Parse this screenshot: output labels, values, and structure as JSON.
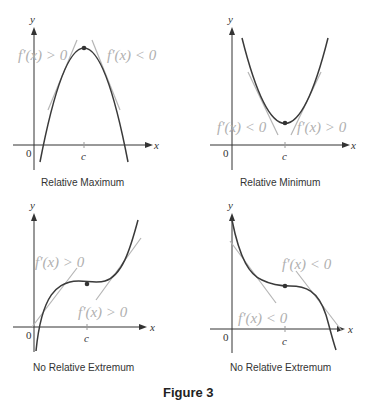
{
  "figure": {
    "label": "Figure 3",
    "panels": [
      {
        "id": "relative-maximum",
        "caption": "Relative Maximum",
        "left_label": "f′(x) > 0",
        "right_label": "f′(x) < 0",
        "x_axis": "x",
        "y_axis": "y",
        "origin": "0",
        "c_tick": "c"
      },
      {
        "id": "relative-minimum",
        "caption": "Relative Minimum",
        "left_label": "f′(x) < 0",
        "right_label": "f′(x) > 0",
        "x_axis": "x",
        "y_axis": "y",
        "origin": "0",
        "c_tick": "c"
      },
      {
        "id": "no-extremum-increasing",
        "caption": "No Relative Extremum",
        "left_label": "f′(x) > 0",
        "right_label": "f′(x) > 0",
        "x_axis": "x",
        "y_axis": "y",
        "origin": "0",
        "c_tick": "c"
      },
      {
        "id": "no-extremum-decreasing",
        "caption": "No Relative Extremum",
        "left_label": "f′(x) < 0",
        "right_label": "f′(x) < 0",
        "x_axis": "x",
        "y_axis": "y",
        "origin": "0",
        "c_tick": "c"
      }
    ]
  },
  "colors": {
    "curve": "#3a3a3a",
    "tangent": "#b5b5b5",
    "axis": "#333333",
    "label": "#b0b0b0"
  }
}
